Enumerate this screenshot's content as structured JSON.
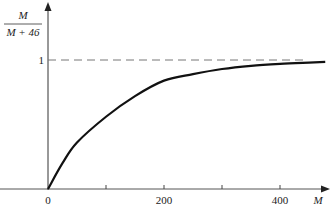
{
  "chart_data": {
    "type": "line",
    "title": "",
    "xlabel": "M",
    "ylabel_numerator": "M",
    "ylabel_denominator": "M + 46",
    "ylabel": "M/(M+46)",
    "xlim": [
      0,
      480
    ],
    "ylim": [
      0,
      1.1
    ],
    "x_ticks": [
      0,
      100,
      200,
      300,
      400
    ],
    "x_tick_labels": [
      "0",
      "",
      "200",
      "",
      "400"
    ],
    "y_ticks": [
      1
    ],
    "y_tick_labels": [
      "1"
    ],
    "asymptote": {
      "y": 1,
      "style": "dashed",
      "label": "1"
    },
    "grid": false,
    "legend": null,
    "series": [
      {
        "name": "curve",
        "x": [
          0,
          25,
          50,
          100,
          150,
          200,
          250,
          300,
          350,
          400,
          450,
          478
        ],
        "y": [
          0,
          0.2,
          0.36,
          0.56,
          0.72,
          0.84,
          0.89,
          0.93,
          0.955,
          0.97,
          0.98,
          0.985
        ]
      }
    ]
  }
}
